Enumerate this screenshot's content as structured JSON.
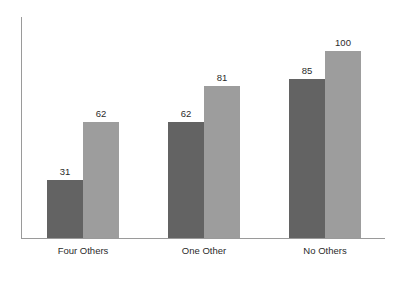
{
  "chart_data": {
    "type": "bar",
    "title": "",
    "subtitle": "",
    "xlabel": "",
    "ylabel": "",
    "categories": [
      "Four Others",
      "One Other",
      "No Others"
    ],
    "series": [
      {
        "name": "series-1",
        "values": [
          31,
          62,
          85
        ],
        "color": "#636363"
      },
      {
        "name": "series-2",
        "values": [
          62,
          81,
          100
        ],
        "color": "#9d9d9d"
      }
    ],
    "data_labels": [
      [
        "31",
        "62"
      ],
      [
        "62",
        "81"
      ],
      [
        "85",
        "100"
      ]
    ],
    "ylim": [
      0,
      118
    ],
    "grid": false,
    "legend": false,
    "legend_position": "none",
    "y_tick_labels": [],
    "x_tick_labels": [
      "Four Others",
      "One Other",
      "No Others"
    ],
    "axis_color": "#9a9a9a",
    "background_color": "#ffffff",
    "label_text_color": "#2b2b2b"
  }
}
